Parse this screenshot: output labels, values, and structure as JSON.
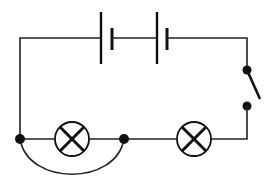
{
  "diagram": {
    "type": "circuit",
    "title": "",
    "components": {
      "battery": {
        "label": "",
        "cells": 2,
        "symbol": "cell"
      },
      "switch": {
        "label": "",
        "state": "open"
      },
      "lamps": [
        {
          "id": "lamp-1",
          "label": "",
          "symbol": "lamp-cross",
          "shorted_by_wire": true
        },
        {
          "id": "lamp-2",
          "label": "",
          "symbol": "lamp-cross",
          "shorted_by_wire": false
        }
      ],
      "junctions": 2
    },
    "colors": {
      "wire": "#222222",
      "background": "#ffffff"
    }
  }
}
